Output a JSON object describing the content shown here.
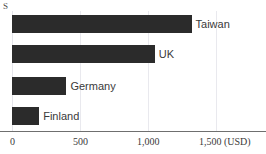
{
  "chart_data": {
    "type": "bar",
    "orientation": "horizontal",
    "title": "",
    "xlabel": "(USD)",
    "ylabel": "",
    "categories": [
      "Taiwan",
      "UK",
      "Germany",
      "Finland"
    ],
    "values": [
      1320,
      1050,
      400,
      200
    ],
    "xlim": [
      0,
      1600
    ],
    "xticks": [
      0,
      500,
      1000,
      1500
    ],
    "xticklabels": [
      "0",
      "500",
      "1,000",
      "1,500"
    ],
    "grid": true,
    "legend": false,
    "bar_color": "#2b2b2b",
    "gridline_color": "#e9e9ee",
    "axis_color": "#6f6f6f",
    "label_color": "#3a3a3a"
  },
  "axis": {
    "currency_marker": "S",
    "unit_suffix": "(USD)",
    "ticks": [
      {
        "label": "0",
        "value": 0
      },
      {
        "label": "500",
        "value": 500
      },
      {
        "label": "1,000",
        "value": 1000
      },
      {
        "label": "1,500",
        "value": 1500
      }
    ]
  },
  "bars": [
    {
      "label": "Taiwan",
      "value": 1320
    },
    {
      "label": "UK",
      "value": 1050
    },
    {
      "label": "Germany",
      "value": 400
    },
    {
      "label": "Finland",
      "value": 200
    }
  ],
  "top_clipped_text": "........ .. ........."
}
